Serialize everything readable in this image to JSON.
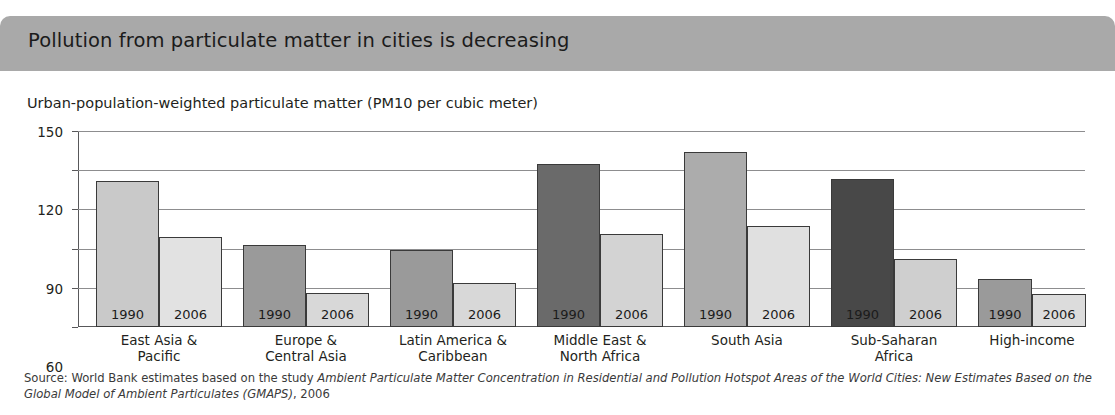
{
  "header": {
    "title": "Pollution from particulate matter in cities is decreasing",
    "band_color": "#a9a9a9"
  },
  "subtitle": "Urban-population-weighted particulate matter (PM10 per cubic meter)",
  "source": {
    "prefix": "Source: World Bank estimates based on the study ",
    "italic": "Ambient Particulate Matter Concentration in Residential and Pollution Hotspot Areas of the World Cities: New Estimates Based on the Global Model of Ambient Particulates (GMAPS)",
    "suffix": ", 2006"
  },
  "chart_data": {
    "type": "bar",
    "title": "Pollution from particulate matter in cities is decreasing",
    "subtitle": "Urban-population-weighted particulate matter (PM10 per cubic meter)",
    "xlabel": "",
    "ylabel": "",
    "ylim": [
      0,
      150
    ],
    "yticks": [
      0,
      30,
      60,
      90,
      120,
      150
    ],
    "ytick_labels": [
      "0",
      "30",
      "60",
      "90",
      "120",
      "150"
    ],
    "grid": true,
    "legend": "none",
    "categories": [
      "East Asia &\nPacific",
      "Europe &\nCentral Asia",
      "Latin America &\nCaribbean",
      "Middle East &\nNorth Africa",
      "South Asia",
      "Sub-Saharan\nAfrica",
      "High-income"
    ],
    "series": [
      {
        "name": "1990",
        "values": [
          112,
          63,
          59,
          125,
          134,
          113,
          37
        ],
        "colors": [
          "#c9c9c9",
          "#9a9a9a",
          "#9a9a9a",
          "#6a6a6a",
          "#acacac",
          "#484848",
          "#9a9a9a"
        ]
      },
      {
        "name": "2006",
        "values": [
          69,
          26,
          34,
          71,
          77,
          52,
          25
        ],
        "colors": [
          "#e2e2e2",
          "#d8d8d8",
          "#d8d8d8",
          "#d3d3d3",
          "#e0e0e0",
          "#cfcfcf",
          "#dcdcdc"
        ]
      }
    ],
    "bar_labels": [
      "1990",
      "2006"
    ]
  }
}
